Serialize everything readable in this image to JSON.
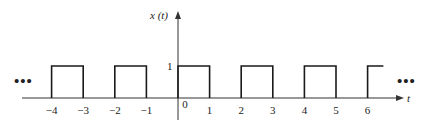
{
  "diagram": {
    "y_axis_label": "x (t)",
    "x_axis_label": "t",
    "amplitude_label": "1",
    "left_ellipsis": "•••",
    "right_ellipsis": "•••",
    "x_ticks": [
      {
        "value": -4,
        "label": "−4"
      },
      {
        "value": -3,
        "label": "−3"
      },
      {
        "value": -2,
        "label": "−2"
      },
      {
        "value": -1,
        "label": "−1"
      },
      {
        "value": 0,
        "label": "0"
      },
      {
        "value": 1,
        "label": "1"
      },
      {
        "value": 2,
        "label": "2"
      },
      {
        "value": 3,
        "label": "3"
      },
      {
        "value": 4,
        "label": "4"
      },
      {
        "value": 5,
        "label": "5"
      },
      {
        "value": 6,
        "label": "6"
      }
    ],
    "pulses": [
      {
        "start": -4,
        "end": -3
      },
      {
        "start": -2,
        "end": -1
      },
      {
        "start": 0,
        "end": 1
      },
      {
        "start": 2,
        "end": 3
      },
      {
        "start": 4,
        "end": 5
      },
      {
        "start": 6,
        "end": 6.5
      }
    ],
    "period": 2,
    "amplitude": 1,
    "line_color": "#1a1a1a"
  }
}
